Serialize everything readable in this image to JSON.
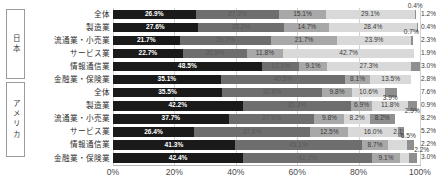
{
  "groups": [
    {
      "name": "japan",
      "label": "日本"
    },
    {
      "name": "america",
      "label": "アメリカ"
    }
  ],
  "chart_data": {
    "type": "bar",
    "subtype": "stacked-100-horizontal",
    "title": "",
    "xlabel": "",
    "ylabel": "",
    "xlim": [
      0,
      100
    ],
    "xticks": [
      "0%",
      "20%",
      "40%",
      "60%",
      "80%",
      "100%"
    ],
    "xtick_values": [
      0,
      20,
      40,
      60,
      80,
      100
    ],
    "grid": true,
    "legend": "none",
    "categories": [
      "全体",
      "製造業",
      "流通業・小売業",
      "サービス業",
      "情報通信業",
      "金融業・保険業",
      "全体",
      "製造業",
      "流通業・小売業",
      "サービス業",
      "情報通信業",
      "金融業・保険業"
    ],
    "group_of_row": [
      "日本",
      "日本",
      "日本",
      "日本",
      "日本",
      "日本",
      "アメリカ",
      "アメリカ",
      "アメリカ",
      "アメリカ",
      "アメリカ",
      "アメリカ"
    ],
    "series": [
      {
        "name": "seg1",
        "color": "#1a1a1a",
        "values": [
          26.9,
          27.6,
          21.7,
          22.7,
          48.5,
          35.1,
          35.5,
          42.2,
          37.7,
          26.4,
          41.3,
          42.4
        ]
      },
      {
        "name": "seg2",
        "color": "#6e6e6e",
        "values": [
          27.3,
          28.2,
          27.7,
          18.8,
          12.1,
          40.5,
          32.6,
          35.3,
          27.9,
          37.8,
          43.1,
          42.0
        ]
      },
      {
        "name": "seg3",
        "color": "#a8a8a8",
        "values": [
          15.1,
          14.7,
          21.7,
          11.8,
          9.1,
          8.1,
          9.8,
          6.9,
          9.8,
          12.5,
          8.7,
          9.1
        ]
      },
      {
        "name": "seg4",
        "color": "#d9d9d9",
        "values": [
          29.1,
          28.4,
          23.9,
          42.7,
          27.3,
          13.5,
          10.6,
          11.8,
          8.2,
          16.0,
          6.5,
          3.0
        ]
      },
      {
        "name": "seg5",
        "color": "#8f8f8f",
        "values": [
          0.4,
          0.4,
          0.7,
          2.1,
          3.0,
          2.8,
          3.9,
          2.9,
          8.2,
          2.1,
          2.2,
          2.5
        ]
      },
      {
        "name": "seg6",
        "color": "#ffffff-dotted",
        "values": [
          1.2,
          0.7,
          2.3,
          1.9,
          0.0,
          0.0,
          7.6,
          0.9,
          8.2,
          5.2,
          2.2,
          1.0
        ]
      }
    ],
    "rows": [
      {
        "group": "日本",
        "category": "全体",
        "segments": [
          {
            "value": 26.9,
            "label": "26.9%",
            "style": "s0",
            "inside": true
          },
          {
            "value": 27.3,
            "label": "27.3%",
            "style": "s1",
            "inside": true
          },
          {
            "value": 15.1,
            "label": "15.1%",
            "style": "s2",
            "inside": true
          },
          {
            "value": 29.1,
            "label": "29.1%",
            "style": "s3",
            "inside": true
          },
          {
            "value": 0.4,
            "label": "0.4%",
            "style": "s4",
            "inside": false,
            "callout": "above"
          },
          {
            "value": 1.2,
            "label": "1.2%",
            "style": "s5",
            "inside": false,
            "callout": "right"
          }
        ]
      },
      {
        "group": "日本",
        "category": "製造業",
        "segments": [
          {
            "value": 27.6,
            "label": "27.6%",
            "style": "s0",
            "inside": true
          },
          {
            "value": 28.2,
            "label": "28.2%",
            "style": "s1",
            "inside": true
          },
          {
            "value": 14.7,
            "label": "14.7%",
            "style": "s2",
            "inside": true
          },
          {
            "value": 28.4,
            "label": "28.4%",
            "style": "s3",
            "inside": true
          },
          {
            "value": 0.4,
            "label": "0.4%",
            "style": "s4",
            "inside": false,
            "callout": "right"
          },
          {
            "value": 0.7,
            "label": "",
            "style": "s5",
            "inside": false
          }
        ]
      },
      {
        "group": "日本",
        "category": "流通業・小売業",
        "segments": [
          {
            "value": 21.7,
            "label": "21.7%",
            "style": "s0",
            "inside": true
          },
          {
            "value": 29.7,
            "label": "29.7%",
            "style": "s1",
            "inside": true
          },
          {
            "value": 21.7,
            "label": "21.7%",
            "style": "s2",
            "inside": true
          },
          {
            "value": 23.9,
            "label": "23.9%",
            "style": "s3",
            "inside": true
          },
          {
            "value": 0.7,
            "label": "0.7%",
            "style": "s4",
            "inside": false,
            "callout": "above"
          },
          {
            "value": 2.3,
            "label": "2.3%",
            "style": "s5",
            "inside": false,
            "callout": "right"
          }
        ]
      },
      {
        "group": "日本",
        "category": "サービス業",
        "segments": [
          {
            "value": 22.7,
            "label": "22.7%",
            "style": "s0",
            "inside": true
          },
          {
            "value": 20.9,
            "label": "20.9%",
            "style": "s1",
            "inside": true
          },
          {
            "value": 11.8,
            "label": "11.8%",
            "style": "s2",
            "inside": true
          },
          {
            "value": 42.7,
            "label": "42.7%",
            "style": "s3",
            "inside": true
          },
          {
            "value": 0.0,
            "label": "",
            "style": "s4",
            "inside": false
          },
          {
            "value": 1.9,
            "label": "1.9%",
            "style": "s5",
            "inside": false,
            "callout": "right"
          }
        ]
      },
      {
        "group": "日本",
        "category": "情報通信業",
        "segments": [
          {
            "value": 48.5,
            "label": "48.5%",
            "style": "s0",
            "inside": true
          },
          {
            "value": 12.1,
            "label": "12.1%",
            "style": "s1",
            "inside": true
          },
          {
            "value": 9.1,
            "label": "9.1%",
            "style": "s2",
            "inside": true
          },
          {
            "value": 27.3,
            "label": "27.3%",
            "style": "s3",
            "inside": true
          },
          {
            "value": 3.0,
            "label": "3.0%",
            "style": "s4",
            "inside": false,
            "callout": "right"
          },
          {
            "value": 0.0,
            "label": "",
            "style": "s5",
            "inside": false
          }
        ]
      },
      {
        "group": "日本",
        "category": "金融業・保険業",
        "segments": [
          {
            "value": 35.1,
            "label": "35.1%",
            "style": "s0",
            "inside": true
          },
          {
            "value": 40.5,
            "label": "40.5%",
            "style": "s1",
            "inside": true
          },
          {
            "value": 8.1,
            "label": "8.1%",
            "style": "s2",
            "inside": true
          },
          {
            "value": 13.5,
            "label": "13.5%",
            "style": "s3",
            "inside": true
          },
          {
            "value": 0.0,
            "label": "",
            "style": "s4",
            "inside": false
          },
          {
            "value": 2.8,
            "label": "2.8%",
            "style": "s5",
            "inside": false,
            "callout": "right"
          }
        ]
      },
      {
        "group": "アメリカ",
        "category": "全体",
        "segments": [
          {
            "value": 35.5,
            "label": "35.5%",
            "style": "s0",
            "inside": true
          },
          {
            "value": 32.6,
            "label": "32.6%",
            "style": "s1",
            "inside": true
          },
          {
            "value": 9.8,
            "label": "9.8%",
            "style": "s2",
            "inside": true
          },
          {
            "value": 10.6,
            "label": "10.6%",
            "style": "s3",
            "inside": true
          },
          {
            "value": 3.9,
            "label": "3.9%",
            "style": "s4",
            "inside": false,
            "callout": "below"
          },
          {
            "value": 7.6,
            "label": "7.6%",
            "style": "s5",
            "inside": false,
            "callout": "right"
          }
        ]
      },
      {
        "group": "アメリカ",
        "category": "製造業",
        "segments": [
          {
            "value": 42.2,
            "label": "42.2%",
            "style": "s0",
            "inside": true
          },
          {
            "value": 35.3,
            "label": "35.3%",
            "style": "s1",
            "inside": true
          },
          {
            "value": 6.9,
            "label": "6.9%",
            "style": "s2",
            "inside": true
          },
          {
            "value": 11.8,
            "label": "11.8%",
            "style": "s3",
            "inside": true
          },
          {
            "value": 2.9,
            "label": "2.9%",
            "style": "s4",
            "inside": false,
            "callout": "below"
          },
          {
            "value": 0.9,
            "label": "0.9%",
            "style": "s5",
            "inside": false,
            "callout": "right"
          }
        ]
      },
      {
        "group": "アメリカ",
        "category": "流通業・小売業",
        "segments": [
          {
            "value": 37.7,
            "label": "37.7%",
            "style": "s0",
            "inside": true
          },
          {
            "value": 27.9,
            "label": "27.9%",
            "style": "s1",
            "inside": true
          },
          {
            "value": 9.8,
            "label": "9.8%",
            "style": "s2",
            "inside": true
          },
          {
            "value": 8.2,
            "label": "8.2%",
            "style": "s3",
            "inside": true
          },
          {
            "value": 8.2,
            "label": "8.2%",
            "style": "s4",
            "inside": true
          },
          {
            "value": 8.2,
            "label": "8.2%",
            "style": "s5",
            "inside": false,
            "callout": "right"
          }
        ]
      },
      {
        "group": "アメリカ",
        "category": "サービス業",
        "segments": [
          {
            "value": 26.4,
            "label": "26.4%",
            "style": "s0",
            "inside": true
          },
          {
            "value": 37.8,
            "label": "37.8%",
            "style": "s1",
            "inside": true
          },
          {
            "value": 12.5,
            "label": "12.5%",
            "style": "s2",
            "inside": true
          },
          {
            "value": 16.0,
            "label": "16.0%",
            "style": "s3",
            "inside": true
          },
          {
            "value": 2.1,
            "label": "2.1%",
            "style": "s4",
            "inside": true
          },
          {
            "value": 5.2,
            "label": "5.2%",
            "style": "s5",
            "inside": false,
            "callout": "right"
          }
        ]
      },
      {
        "group": "アメリカ",
        "category": "情報通信業",
        "segments": [
          {
            "value": 41.3,
            "label": "41.3%",
            "style": "s0",
            "inside": true
          },
          {
            "value": 43.1,
            "label": "43.1%",
            "style": "s1",
            "inside": true
          },
          {
            "value": 8.7,
            "label": "8.7%",
            "style": "s2",
            "inside": true
          },
          {
            "value": 6.5,
            "label": "6.5%",
            "style": "s3",
            "inside": false,
            "callout": "above"
          },
          {
            "value": 2.2,
            "label": "2.2%",
            "style": "s4",
            "inside": false,
            "callout": "below"
          },
          {
            "value": 2.2,
            "label": "2.2%",
            "style": "s5",
            "inside": false,
            "callout": "right"
          }
        ]
      },
      {
        "group": "アメリカ",
        "category": "金融業・保険業",
        "segments": [
          {
            "value": 42.4,
            "label": "42.4%",
            "style": "s0",
            "inside": true
          },
          {
            "value": 42.0,
            "label": "42.0%",
            "style": "s1",
            "inside": true
          },
          {
            "value": 9.1,
            "label": "9.1%",
            "style": "s2",
            "inside": true
          },
          {
            "value": 3.0,
            "label": "3.0%",
            "style": "s3",
            "inside": false,
            "callout": "right"
          },
          {
            "value": 2.5,
            "label": "",
            "style": "s4",
            "inside": false
          },
          {
            "value": 1.0,
            "label": "",
            "style": "s5",
            "inside": false
          }
        ]
      }
    ]
  }
}
